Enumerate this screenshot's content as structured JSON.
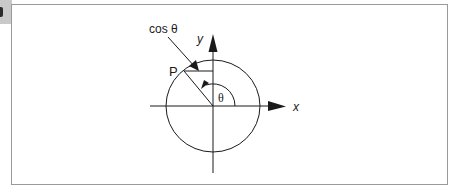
{
  "figure": {
    "corner_tab": {
      "color": "#c9c9c9"
    },
    "frame": {
      "border_color": "#9a9a9a"
    },
    "labels": {
      "cos_theta": "cos θ",
      "point": "P",
      "y_axis": "y",
      "x_axis": "x",
      "angle": "θ"
    },
    "geometry": {
      "origin": [
        213,
        106
      ],
      "circle_rx": 47,
      "circle_ry": 46,
      "point_P": [
        184,
        71
      ],
      "angle_arc_radius": 22
    },
    "stroke_color": "#1a1a1a"
  }
}
